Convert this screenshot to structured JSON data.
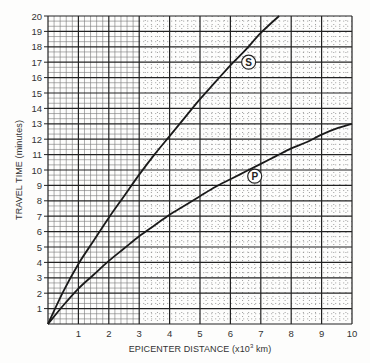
{
  "chart_data": {
    "type": "line",
    "title": "",
    "xlabel": "EPICENTER DISTANCE (x10^3 km)",
    "ylabel": "TRAVEL TIME (minutes)",
    "xlim": [
      0,
      10
    ],
    "ylim": [
      0,
      20
    ],
    "x_ticks": [
      1,
      2,
      3,
      4,
      5,
      6,
      7,
      8,
      9,
      10
    ],
    "y_ticks": [
      1,
      2,
      3,
      4,
      5,
      6,
      7,
      8,
      9,
      10,
      11,
      12,
      13,
      14,
      15,
      16,
      17,
      18,
      19,
      20
    ],
    "grid": true,
    "legend_position": "inline",
    "series": [
      {
        "name": "S",
        "x": [
          0,
          0.5,
          1,
          1.5,
          2,
          2.5,
          3,
          3.5,
          4,
          4.5,
          5,
          5.5,
          6,
          6.5,
          7,
          7.6
        ],
        "y": [
          0,
          2.1,
          3.9,
          5.4,
          6.9,
          8.3,
          9.7,
          11.0,
          12.2,
          13.4,
          14.6,
          15.7,
          16.8,
          17.8,
          18.9,
          20.0
        ]
      },
      {
        "name": "P",
        "x": [
          0,
          0.5,
          1,
          1.5,
          2,
          2.5,
          3,
          3.5,
          4,
          4.5,
          5,
          5.5,
          6,
          6.5,
          7,
          7.5,
          8,
          8.5,
          9,
          9.5,
          10
        ],
        "y": [
          0,
          1.2,
          2.3,
          3.2,
          4.1,
          4.9,
          5.7,
          6.4,
          7.1,
          7.7,
          8.3,
          8.9,
          9.4,
          9.9,
          10.4,
          10.9,
          11.4,
          11.8,
          12.3,
          12.7,
          13.0
        ]
      }
    ],
    "annotations": [
      {
        "text": "S",
        "x": 6.6,
        "y": 17.0,
        "style": "circled"
      },
      {
        "text": "P",
        "x": 6.8,
        "y": 9.6,
        "style": "circled"
      }
    ]
  },
  "labels": {
    "xlabel_prefix": "EPICENTER DISTANCE (x10",
    "xlabel_sup": "3",
    "xlabel_suffix": " km)",
    "ylabel": "TRAVEL TIME (minutes)"
  }
}
